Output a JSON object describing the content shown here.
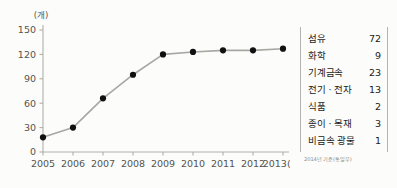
{
  "chart_data": {
    "type": "line",
    "title": "",
    "xlabel": "",
    "ylabel": "",
    "yunit": "(개)",
    "xunit": "(년)",
    "categories": [
      "2005",
      "2006",
      "2007",
      "2008",
      "2009",
      "2010",
      "2011",
      "2012",
      "2013"
    ],
    "xtick_labels": [
      "2005",
      "2006",
      "2007",
      "2008",
      "2009",
      "2010",
      "2011",
      "2012",
      "2013(년)"
    ],
    "values": [
      18,
      30,
      66,
      95,
      120,
      123,
      125,
      125,
      127
    ],
    "ytick_labels": [
      "0",
      "30",
      "60",
      "90",
      "120",
      "150"
    ],
    "ytick_values": [
      0,
      30,
      60,
      90,
      120,
      150
    ],
    "ylim": [
      0,
      150
    ],
    "grid": false,
    "legend": false,
    "marker": "filled-circle",
    "line_color": "#a8a8a2",
    "marker_color": "#111111",
    "axis_color": "#b0b0aa"
  },
  "table": {
    "rows": [
      {
        "label": "섬유",
        "value": "72"
      },
      {
        "label": "화학",
        "value": "9"
      },
      {
        "label": "기계금속",
        "value": "23"
      },
      {
        "label": "전기 · 전자",
        "value": "13"
      },
      {
        "label": "식품",
        "value": "2"
      },
      {
        "label": "종이 · 목재",
        "value": "3"
      },
      {
        "label": "비금속 광물",
        "value": "1"
      }
    ],
    "source_note": "2014년 기준(통일부)"
  }
}
